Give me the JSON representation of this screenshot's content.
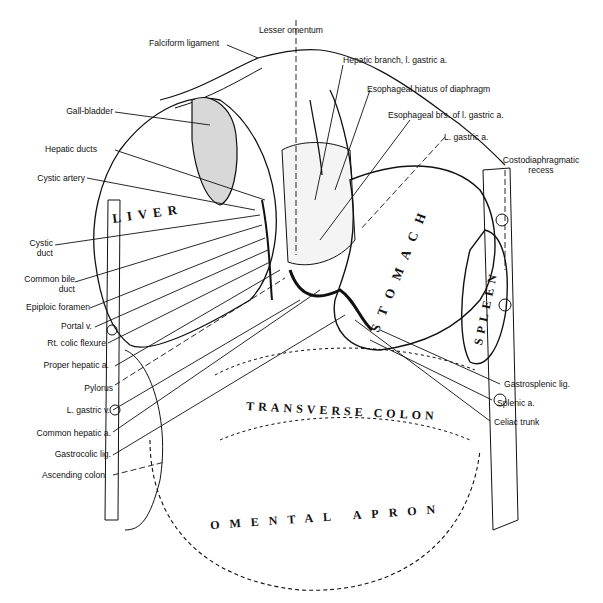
{
  "figure": {
    "organs": {
      "liver": "LIVER",
      "stomach": "STOMACH",
      "spleen": "SPLEEN",
      "transverse_colon": "TRANSVERSE COLON",
      "omental_apron": "OMENTAL APRON"
    },
    "labels_top": {
      "falciform": "Falciform ligament",
      "lesser_omentum": "Lesser omentum",
      "hepatic_branch": "Hepatic branch, l. gastric a.",
      "esophageal_hiatus": "Esophageal hiatus of diaphragm",
      "esophageal_brs": "Esophageal brs. of l. gastric a.",
      "l_gastric_a": "L. gastric a.",
      "costodiaphragmatic_1": "Costodiaphragmatic",
      "costodiaphragmatic_2": "recess"
    },
    "labels_left": {
      "gall_bladder": "Gall-bladder",
      "hepatic_ducts": "Hepatic ducts",
      "cystic_artery": "Cystic artery",
      "cystic_duct_1": "Cystic",
      "cystic_duct_2": "duct",
      "common_bile_1": "Common bile",
      "common_bile_2": "duct",
      "epiploic": "Epiploic foramen",
      "portal_v": "Portal v.",
      "rt_colic": "Rt. colic flexure",
      "proper_hepatic": "Proper hepatic a.",
      "pylorus": "Pylorus",
      "l_gastric_v": "L. gastric v.",
      "common_hepatic": "Common hepatic a.",
      "gastrocolic": "Gastrocolic lig.",
      "ascending_colon": "Ascending colon"
    },
    "labels_right": {
      "gastrosplenic": "Gastrosplenic lig.",
      "splenic_a": "Splenic a.",
      "celiac": "Celiac trunk"
    }
  }
}
